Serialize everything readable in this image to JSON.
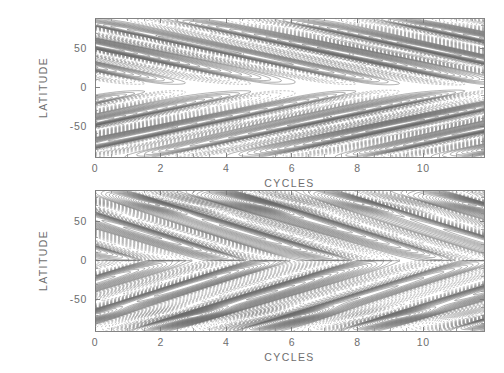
{
  "figure": {
    "title": "",
    "background_color": "#ffffff",
    "line_color": "#6a6a6a",
    "dashed_line_color": "#8a8a8a",
    "axis_color": "#777777",
    "text_color": "#6e6e6e",
    "width": 504,
    "height": 373
  },
  "chart_data": {
    "type": "line",
    "plot_kind": "contour",
    "panels": [
      {
        "id": "upper",
        "name": "upper-panel",
        "title": "",
        "xlabel": "CYCLES",
        "ylabel": "LATITUDE",
        "xlim": [
          0,
          11.85
        ],
        "ylim": [
          -90,
          90
        ],
        "xticks": [
          0,
          2,
          4,
          6,
          8,
          10
        ],
        "xticklabels": [
          "0",
          "2",
          "4",
          "6",
          "8",
          "10"
        ],
        "xminor_step": 0.5,
        "yticks": [
          50,
          0,
          -50
        ],
        "yticklabels": [
          "50",
          "0",
          "-50"
        ],
        "yminor_step": 10,
        "grid": false,
        "legend": "none",
        "frame": {
          "x": 95,
          "y": 18,
          "width": 389,
          "height": 139
        },
        "features": {
          "cell_period": 3.2,
          "cell_count": 4,
          "north_band_center": 50,
          "south_band_center": -50,
          "band_half_width": 40,
          "equator_gap": true,
          "equator_gap_halfwidth": 12,
          "drift_per_cycle": -9,
          "contour_levels": 17,
          "amplitude": 1.0,
          "dense_pole_bands": false
        }
      },
      {
        "id": "lower",
        "name": "lower-panel",
        "title": "",
        "xlabel": "CYCLES",
        "ylabel": "LATITUDE",
        "xlim": [
          0,
          11.85
        ],
        "ylim": [
          -90,
          90
        ],
        "xticks": [
          0,
          2,
          4,
          6,
          8,
          10
        ],
        "xticklabels": [
          "0",
          "2",
          "4",
          "6",
          "8",
          "10"
        ],
        "xminor_step": 0.5,
        "yticks": [
          50,
          0,
          -50
        ],
        "yticklabels": [
          "50",
          "0",
          "-50"
        ],
        "yminor_step": 10,
        "grid": false,
        "legend": "none",
        "frame": {
          "x": 95,
          "y": 190,
          "width": 389,
          "height": 141
        },
        "features": {
          "cell_period": 3.2,
          "cell_count": 4,
          "north_band_center": 40,
          "south_band_center": -40,
          "band_half_width": 52,
          "equator_gap": false,
          "equator_gap_halfwidth": 0,
          "drift_per_cycle": -13,
          "contour_levels": 26,
          "amplitude": 1.0,
          "dense_pole_bands": true,
          "pole_band_latitude": 72
        }
      }
    ]
  },
  "labels": {
    "xaxis_title": "CYCLES",
    "yaxis_title": "LATITUDE"
  }
}
